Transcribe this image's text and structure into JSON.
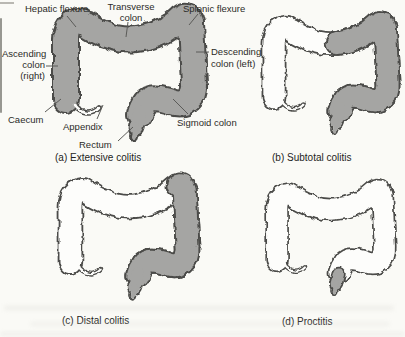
{
  "figure": {
    "type": "medical-diagram",
    "colors": {
      "paper": "#fdfdfb",
      "background": "#fafaf6",
      "shade": "#a5a5a3",
      "outline": "#4c4c49"
    },
    "anatomy_labels": {
      "hepatic_flexure": "Hepatic flexure",
      "transverse_colon": "Transverse\ncolon",
      "splenic_flexure": "Splenic flexure",
      "ascending_colon": "Ascending\ncolon\n(right)",
      "descending_colon": "Descending\ncolon (left)",
      "caecum": "Caecum",
      "appendix": "Appendix",
      "rectum": "Rectum",
      "sigmoid_colon": "Sigmoid colon"
    },
    "panels": [
      {
        "key": "a",
        "caption": "(a) Extensive colitis",
        "shaded_segments": [
          "caecum",
          "ascending colon",
          "transverse colon",
          "descending colon",
          "sigmoid colon",
          "rectum"
        ]
      },
      {
        "key": "b",
        "caption": "(b) Subtotal colitis",
        "shaded_segments": [
          "distal transverse colon",
          "descending colon",
          "sigmoid colon",
          "rectum"
        ]
      },
      {
        "key": "c",
        "caption": "(c) Distal colitis",
        "shaded_segments": [
          "descending colon",
          "sigmoid colon",
          "rectum"
        ]
      },
      {
        "key": "d",
        "caption": "(d) Proctitis",
        "shaded_segments": [
          "rectum"
        ]
      }
    ]
  }
}
